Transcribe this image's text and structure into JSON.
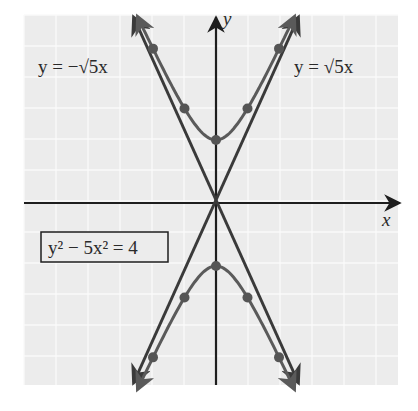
{
  "chart_data": {
    "type": "line",
    "title": "",
    "xlabel": "x",
    "ylabel": "y",
    "xlim": [
      -6,
      6
    ],
    "ylim": [
      -5.8,
      6
    ],
    "grid": true,
    "legend_position": "none",
    "series": [
      {
        "name": "y^2 - 5x^2 = 4 (upper branch)",
        "kind": "hyperbola",
        "points": [
          [
            -2,
            4.9
          ],
          [
            -1,
            3
          ],
          [
            0,
            2
          ],
          [
            1,
            3
          ],
          [
            2,
            4.9
          ]
        ]
      },
      {
        "name": "y^2 - 5x^2 = 4 (lower branch)",
        "kind": "hyperbola",
        "points": [
          [
            -2,
            -4.9
          ],
          [
            -1,
            -3
          ],
          [
            0,
            -2
          ],
          [
            1,
            -3
          ],
          [
            2,
            -4.9
          ]
        ]
      },
      {
        "name": "y = √5x",
        "kind": "asymptote",
        "slope": 2.236
      },
      {
        "name": "y = -√5x",
        "kind": "asymptote",
        "slope": -2.236
      }
    ],
    "annotations": [
      {
        "text": "y = −√5x",
        "position": "upper-left"
      },
      {
        "text": "y = √5x",
        "position": "upper-right"
      },
      {
        "text": "y² − 5x² = 4",
        "position": "lower-left",
        "boxed": true
      }
    ]
  },
  "labels": {
    "x_axis": "x",
    "y_axis": "y",
    "neg_asymptote": "y = −√5x",
    "pos_asymptote": "y = √5x",
    "equation": "y² − 5x² = 4"
  },
  "colors": {
    "background": "#ececec",
    "grid": "#fafafa",
    "axis": "#1e1e1e",
    "asymptote": "#3a3a3a",
    "hyperbola": "#5a5a5a",
    "point": "#555555"
  }
}
